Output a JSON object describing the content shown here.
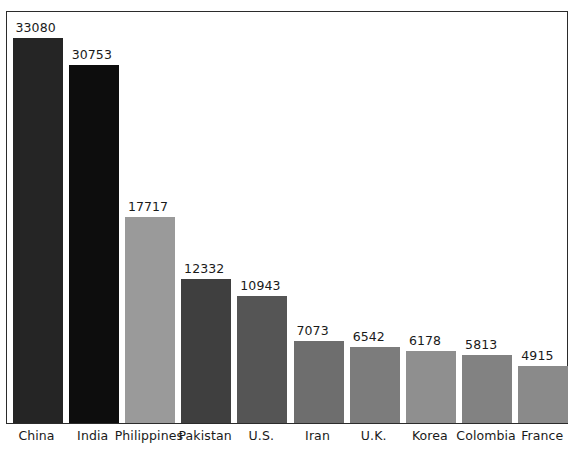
{
  "chart_data": {
    "type": "bar",
    "title": "",
    "subtitle": "",
    "xlabel": "",
    "ylabel": "",
    "grid": false,
    "legend": "none",
    "axis_visible": "frame-box",
    "ylim": [
      0,
      35500
    ],
    "categories": [
      "China",
      "India",
      "Philippines",
      "Pakistan",
      "U.S.",
      "Iran",
      "U.K.",
      "Korea",
      "Colombia",
      "France"
    ],
    "values": [
      33080,
      30753,
      17717,
      12332,
      10943,
      7073,
      6542,
      6178,
      5813,
      4915
    ],
    "value_labels": [
      "33080",
      "30753",
      "17717",
      "12332",
      "10943",
      "7073",
      "6542",
      "6178",
      "5813",
      "4915"
    ],
    "bar_colors": [
      "#252525",
      "#0d0d0d",
      "#9a9a9a",
      "#3f3f3f",
      "#555555",
      "#6e6e6e",
      "#7c7c7c",
      "#8f8f8f",
      "#828282",
      "#8a8a8a"
    ],
    "bars": [
      {
        "category": "China",
        "value": 33080,
        "label": "33080",
        "color": "#252525"
      },
      {
        "category": "India",
        "value": 30753,
        "label": "30753",
        "color": "#0d0d0d"
      },
      {
        "category": "Philippines",
        "value": 17717,
        "label": "17717",
        "color": "#9a9a9a"
      },
      {
        "category": "Pakistan",
        "value": 12332,
        "label": "12332",
        "color": "#3f3f3f"
      },
      {
        "category": "U.S.",
        "value": 10943,
        "label": "10943",
        "color": "#555555"
      },
      {
        "category": "Iran",
        "value": 7073,
        "label": "7073",
        "color": "#6e6e6e"
      },
      {
        "category": "U.K.",
        "value": 6542,
        "label": "6542",
        "color": "#7c7c7c"
      },
      {
        "category": "Korea",
        "value": 6178,
        "label": "6178",
        "color": "#8f8f8f"
      },
      {
        "category": "Colombia",
        "value": 5813,
        "label": "5813",
        "color": "#828282"
      },
      {
        "category": "France",
        "value": 4915,
        "label": "4915",
        "color": "#8a8a8a"
      }
    ]
  },
  "style": {
    "frame_color": "#2b2b2b",
    "background": "#ffffff",
    "text_color": "#1a1a1a"
  },
  "geometry": {
    "frame_left": 6,
    "frame_top": 11,
    "frame_width": 562,
    "frame_height": 413,
    "baseline_y": 424,
    "bar_width": 50,
    "bar_pitch": 56.2,
    "first_bar_left": 7,
    "px_per_unit": 0.01164,
    "label_offset_y": 17
  }
}
